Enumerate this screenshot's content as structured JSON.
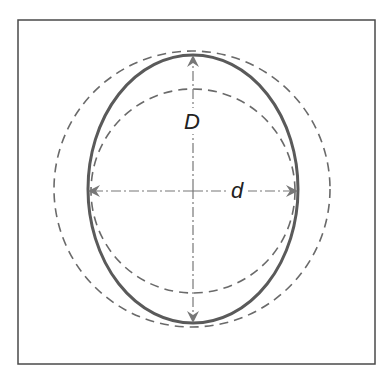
{
  "diagram": {
    "labels": {
      "major_axis": "D",
      "minor_axis": "d"
    },
    "shapes": {
      "frame": "rectangle-border",
      "ellipse": "solid-oval",
      "outer_circle": "dashed-circle",
      "inner_circle": "dashed-circle"
    },
    "colors": {
      "frame": "#4a4a4a",
      "ellipse": "#5a5a5a",
      "dashed": "#6a6a6a",
      "axis": "#7a7a7a",
      "label": "#222222"
    }
  }
}
